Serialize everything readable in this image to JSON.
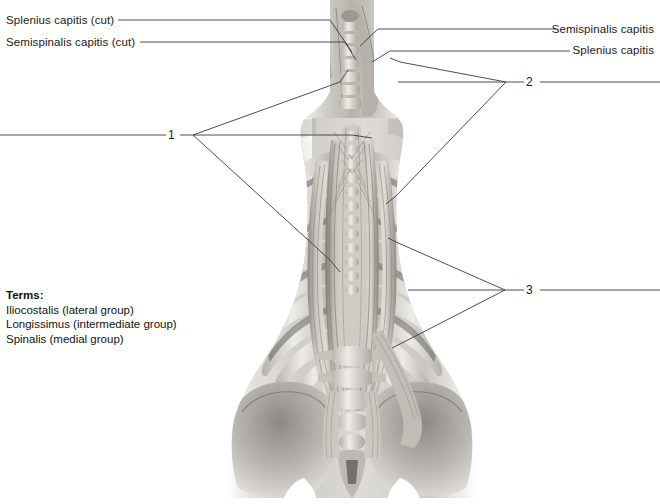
{
  "figure": {
    "illustration_name": "posterior-deep-back-muscles-illustration",
    "palette": {
      "background": "#ffffff",
      "text": "#1a1a1a",
      "leader_line": "#3a3a3a",
      "muscle_light": "#d8d5cf",
      "muscle_mid": "#a9a59d",
      "muscle_dark": "#6e6a64",
      "bone_light": "#e8e6e1",
      "bone_mid": "#bfbcb6",
      "skin_light": "#ecebe8",
      "skin_mid": "#c6c4c0",
      "shadow": "#7d7a75"
    }
  },
  "labels": {
    "left": [
      {
        "id": "splenius-capitis-cut",
        "text": "Splenius capitis (cut)",
        "x": 6,
        "y": 14
      },
      {
        "id": "semispinalis-capitis-cut",
        "text": "Semispinalis capitis (cut)",
        "x": 6,
        "y": 36
      }
    ],
    "right": [
      {
        "id": "semispinalis-capitis",
        "text": "Semispinalis capitis",
        "right": 6,
        "y": 23
      },
      {
        "id": "splenius-capitis",
        "text": "Splenius capitis",
        "right": 6,
        "y": 44
      }
    ]
  },
  "callouts": [
    {
      "id": "callout-1",
      "number": "1",
      "x": 168,
      "y": 129
    },
    {
      "id": "callout-2",
      "number": "2",
      "x": 526,
      "y": 76
    },
    {
      "id": "callout-3",
      "number": "3",
      "x": 526,
      "y": 284
    }
  ],
  "terms": {
    "heading": "Terms:",
    "items": [
      "Iliocostalis (lateral group)",
      "Longissimus (intermediate group)",
      "Spinalis (medial group)"
    ]
  }
}
